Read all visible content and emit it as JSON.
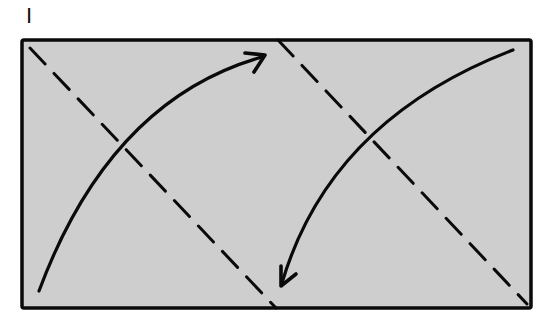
{
  "step_label": "I",
  "colors": {
    "paper_fill": "#cecece",
    "stroke": "#0a0a0a",
    "background": "#ffffff"
  },
  "diagram": {
    "type": "paper-folding-instruction",
    "rectangle": {
      "x": 22,
      "y": 40,
      "width": 509,
      "height": 268
    },
    "fold_lines": [
      {
        "name": "left-valley-fold",
        "style": "dashed",
        "from": [
          30,
          48
        ],
        "to": [
          276,
          308
        ]
      },
      {
        "name": "right-valley-fold",
        "style": "dashed",
        "from": [
          278,
          40
        ],
        "to": [
          527,
          304
        ]
      }
    ],
    "arrows": [
      {
        "name": "fold-arrow-up-right",
        "from": [
          39,
          291
        ],
        "to": [
          265,
          55
        ],
        "direction": "up-right"
      },
      {
        "name": "fold-arrow-down-left",
        "from": [
          513,
          50
        ],
        "to": [
          281,
          286
        ],
        "direction": "down-left"
      }
    ]
  }
}
